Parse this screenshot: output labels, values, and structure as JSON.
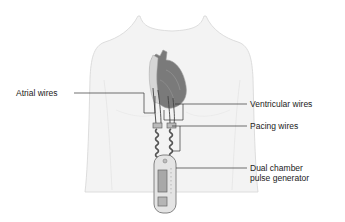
{
  "diagram": {
    "labels": {
      "atrial_wires": "Atrial wires",
      "ventricular_wires": "Ventricular wires",
      "pacing_wires": "Pacing wires",
      "pulse_generator_line1": "Dual chamber",
      "pulse_generator_line2": "pulse generator"
    },
    "colors": {
      "body_fill": "#f3f3f3",
      "body_outline": "#d4d4d4",
      "heart_dark": "#6e6e6e",
      "heart_light": "#cfcfcf",
      "leader_line": "#333333",
      "text": "#222222"
    }
  }
}
